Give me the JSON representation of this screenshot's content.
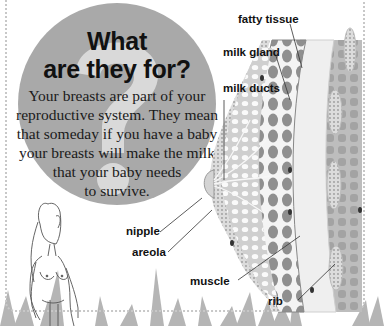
{
  "heading": {
    "line1": "What",
    "line2": "are they for?"
  },
  "body": {
    "lines": [
      "Your breasts are part of your",
      "reproductive system. They mean",
      "that someday if you have a baby",
      "your breasts will make the milk",
      "that your baby needs",
      "to survive."
    ]
  },
  "labels": {
    "fatty_tissue": "fatty tissue",
    "milk_gland": "milk gland",
    "milk_ducts": "milk ducts",
    "nipple": "nipple",
    "areola": "areola",
    "muscle": "muscle",
    "rib": "rib"
  },
  "colors": {
    "circle": "#a9a9a9",
    "question_mark": "#d9d9d9",
    "tissue_dark": "#8e8e8e",
    "tissue_light": "#e6e6e6"
  }
}
